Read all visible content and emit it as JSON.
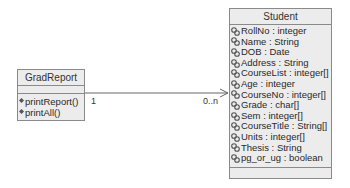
{
  "diagram": {
    "type": "uml-class-diagram",
    "classes": [
      {
        "name": "GradReport",
        "attributes": [],
        "operations": [
          "printReport()",
          "printAll()"
        ]
      },
      {
        "name": "Student",
        "attributes": [
          "RollNo : integer",
          "Name : String",
          "DOB : Date",
          "Address : String",
          "CourseList : integer[]",
          "Age : integer",
          "CourseNo : integer[]",
          "Grade : char[]",
          "Sem : integer[]",
          "CourseTitle : String[]",
          "Units : integer[]",
          "Thesis : String",
          "pg_or_ug : boolean"
        ],
        "operations": []
      }
    ],
    "association": {
      "from": "GradReport",
      "to": "Student",
      "navigable": "to",
      "from_multiplicity": "1",
      "to_multiplicity": "0..n"
    },
    "icons": {
      "attribute": "attribute-icon",
      "operation": "operation-icon"
    },
    "colors": {
      "box_fill": "#ececec",
      "box_border": "#8a8a8a",
      "line": "#666666"
    }
  }
}
